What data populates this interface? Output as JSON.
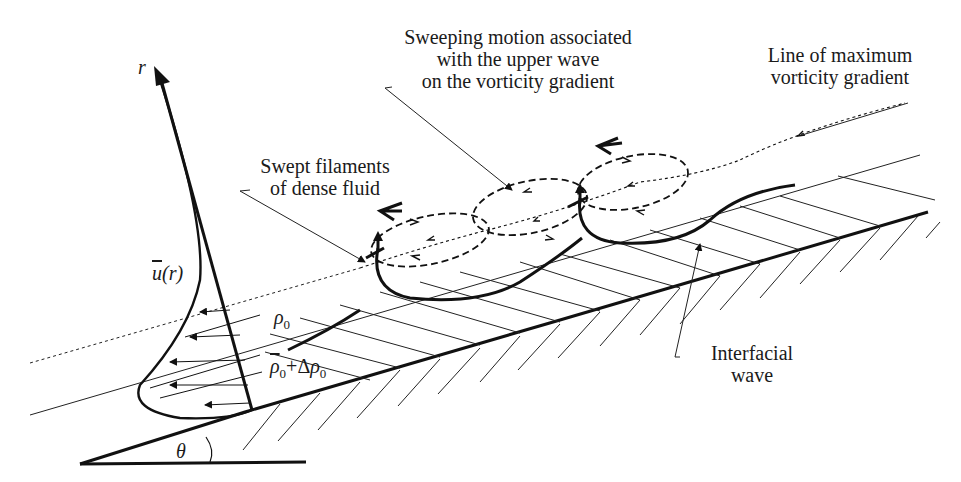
{
  "diagram": {
    "labels": {
      "sweeping_motion": [
        "Sweeping motion associated",
        "with the upper wave",
        "on the vorticity gradient"
      ],
      "line_max_vorticity": [
        "Line of maximum",
        "vorticity gradient"
      ],
      "swept_filaments": [
        "Swept filaments",
        "of dense fluid"
      ],
      "interfacial_wave": [
        "Interfacial",
        "wave"
      ]
    },
    "symbols": {
      "r_axis": "r",
      "u_bar": "u",
      "u_arg": "(r)",
      "rho": "ρ",
      "rho_sub": "0",
      "plus_delta": "+Δ",
      "theta": "θ"
    },
    "colors": {
      "stroke": "#111111",
      "text": "#1a1a1a",
      "background": "#ffffff"
    }
  }
}
